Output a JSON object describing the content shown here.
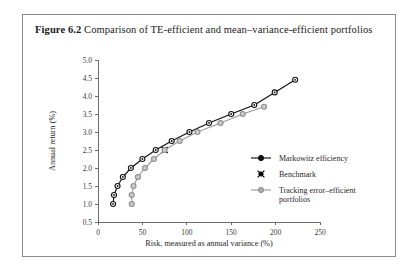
{
  "figure": {
    "label": "Figure 6.2",
    "caption": "Comparison of TE-efficient and mean–variance-efficient portfolios"
  },
  "chart_data": {
    "type": "line",
    "title": "",
    "xlabel": "Risk, measured as annual variance (%)",
    "ylabel": "Annual return (%)",
    "xlim": [
      0,
      250
    ],
    "ylim": [
      0.5,
      5.0
    ],
    "xticks": [
      0,
      50,
      100,
      150,
      200,
      250
    ],
    "yticks": [
      0.5,
      1.0,
      1.5,
      2.0,
      2.5,
      3.0,
      3.5,
      4.0,
      4.5,
      5.0
    ],
    "xtick_labels": [
      "0",
      "50",
      "100",
      "150",
      "200",
      "250"
    ],
    "ytick_labels": [
      "0.5",
      "1.0",
      "1.5",
      "2.0",
      "2.5",
      "3.0",
      "3.5",
      "4.0",
      "4.5",
      "5.0"
    ],
    "grid": false,
    "legend_position": "right-middle",
    "series": [
      {
        "name": "Markowitz efficiency",
        "color": "#101010",
        "marker": "circle-open",
        "points": [
          {
            "x": 17,
            "y": 1.0
          },
          {
            "x": 18,
            "y": 1.25
          },
          {
            "x": 22,
            "y": 1.5
          },
          {
            "x": 28,
            "y": 1.75
          },
          {
            "x": 37,
            "y": 2.0
          },
          {
            "x": 50,
            "y": 2.25
          },
          {
            "x": 65,
            "y": 2.5
          },
          {
            "x": 83,
            "y": 2.75
          },
          {
            "x": 103,
            "y": 3.0
          },
          {
            "x": 125,
            "y": 3.25
          },
          {
            "x": 150,
            "y": 3.5
          },
          {
            "x": 176,
            "y": 3.75
          },
          {
            "x": 199,
            "y": 4.1
          },
          {
            "x": 222,
            "y": 4.45
          }
        ]
      },
      {
        "name": "Benchmark",
        "color": "#000000",
        "marker": "cross-filled",
        "points": [
          {
            "x": 75,
            "y": 2.5
          }
        ]
      },
      {
        "name": "Tracking error–efficient portfolios",
        "color": "#9b9b9b",
        "marker": "circle-filled",
        "points": [
          {
            "x": 38,
            "y": 1.0
          },
          {
            "x": 38,
            "y": 1.25
          },
          {
            "x": 40,
            "y": 1.5
          },
          {
            "x": 45,
            "y": 1.75
          },
          {
            "x": 53,
            "y": 2.0
          },
          {
            "x": 63,
            "y": 2.25
          },
          {
            "x": 75,
            "y": 2.5
          },
          {
            "x": 92,
            "y": 2.75
          },
          {
            "x": 112,
            "y": 3.0
          },
          {
            "x": 138,
            "y": 3.25
          },
          {
            "x": 163,
            "y": 3.5
          },
          {
            "x": 187,
            "y": 3.7
          }
        ]
      }
    ]
  },
  "legend": {
    "entries": [
      {
        "label": "Markowitz efficiency"
      },
      {
        "label": "Benchmark"
      },
      {
        "label": "Tracking error–efficient"
      },
      {
        "label": "portfolios"
      }
    ]
  }
}
